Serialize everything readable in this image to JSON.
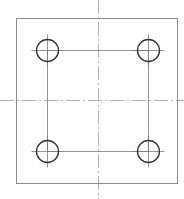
{
  "drawing": {
    "title": "Square plate with four holes",
    "width": 184,
    "height": 199,
    "colors": {
      "background": "#ffffff",
      "outline": "#8c8c8c",
      "hole": "#333333",
      "centerline": "#b4b4b4",
      "construction": "#7a7a7a"
    },
    "plate": {
      "x": 16,
      "y": 18,
      "width": 161,
      "height": 165
    },
    "centerlines": {
      "vertical": {
        "x": 98,
        "y1": 0,
        "y2": 199
      },
      "horizontal": {
        "y": 100,
        "x1": 0,
        "x2": 184
      }
    },
    "hole_pattern": {
      "x1": 47,
      "y1": 50,
      "x2": 148,
      "y2": 151
    },
    "holes": [
      {
        "id": "top-left",
        "cx": 47,
        "cy": 50,
        "r": 11
      },
      {
        "id": "top-right",
        "cx": 148,
        "cy": 50,
        "r": 11
      },
      {
        "id": "bottom-left",
        "cx": 47,
        "cy": 151,
        "r": 11
      },
      {
        "id": "bottom-right",
        "cx": 148,
        "cy": 151,
        "r": 11
      }
    ],
    "crosshair_extension": 5
  }
}
